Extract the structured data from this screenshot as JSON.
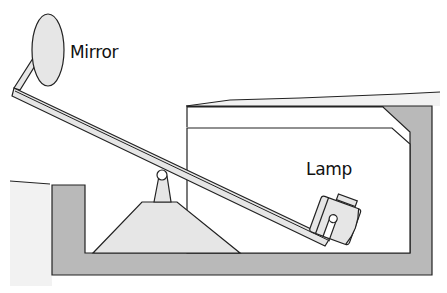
{
  "diagram": {
    "labels": {
      "mirror": "Mirror",
      "lamp": "Lamp"
    },
    "colors": {
      "wall_fill": "#b9b9b9",
      "light_fill": "#e6e6e6",
      "ground_fill": "#f0f0f0",
      "stroke": "#222222",
      "background": "#ffffff"
    }
  }
}
